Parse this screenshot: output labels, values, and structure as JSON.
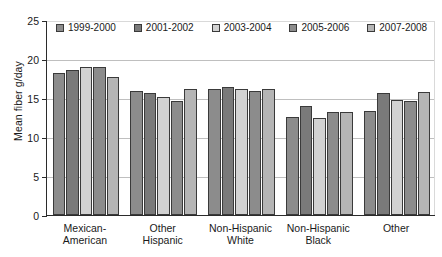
{
  "chart_data": {
    "type": "bar",
    "title": "",
    "xlabel": "",
    "ylabel": "Mean fiber g/day",
    "ylim": [
      0,
      25
    ],
    "yticks": [
      0,
      5,
      10,
      15,
      20,
      25
    ],
    "ytick_labels": [
      "0",
      "5",
      "10",
      "15",
      "20",
      "25"
    ],
    "grid": true,
    "legend_position": "top-left-inside",
    "categories": [
      "Mexican-\nAmerican",
      "Other\nHispanic",
      "Non-Hispanic\nWhite",
      "Non-Hispanic\nBlack",
      "Other"
    ],
    "category_lines": [
      [
        "Mexican-",
        "American"
      ],
      [
        "Other",
        "Hispanic"
      ],
      [
        "Non-Hispanic",
        "White"
      ],
      [
        "Non-Hispanic",
        "Black"
      ],
      [
        "Other",
        ""
      ]
    ],
    "series": [
      {
        "name": "1999-2000",
        "color": "#8c8c8c",
        "values": [
          18.2,
          15.9,
          16.2,
          12.6,
          13.3
        ]
      },
      {
        "name": "2001-2002",
        "color": "#7a7a7a",
        "values": [
          18.6,
          15.6,
          16.4,
          14.0,
          15.7
        ]
      },
      {
        "name": "2003-2004",
        "color": "#d2d2d2",
        "values": [
          19.0,
          15.1,
          16.1,
          12.4,
          14.8
        ]
      },
      {
        "name": "2005-2006",
        "color": "#8c8c8c",
        "values": [
          19.0,
          14.6,
          15.9,
          13.2,
          14.6
        ]
      },
      {
        "name": "2007-2008",
        "color": "#b5b5b5",
        "values": [
          17.7,
          16.1,
          16.1,
          13.2,
          15.8
        ]
      }
    ]
  },
  "legend": {
    "items": [
      {
        "label": "1999-2000"
      },
      {
        "label": "2001-2002"
      },
      {
        "label": "2003-2004"
      },
      {
        "label": "2005-2006"
      },
      {
        "label": "2007-2008"
      }
    ]
  }
}
